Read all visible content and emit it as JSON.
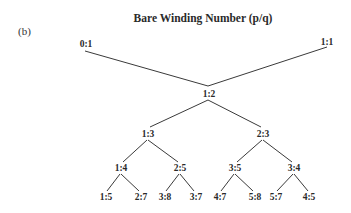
{
  "figure": {
    "panel_label": "(b)",
    "title": "Bare Winding Number (p/q)"
  },
  "tree": {
    "type": "Farey tree",
    "nodes": [
      {
        "id": "n01",
        "label": "0:1",
        "level": 0,
        "x": 86,
        "y": 47,
        "anchor": "middle"
      },
      {
        "id": "n11",
        "label": "1:1",
        "level": 0,
        "x": 327,
        "y": 45,
        "anchor": "middle"
      },
      {
        "id": "n12",
        "label": "1:2",
        "level": 1,
        "x": 209,
        "y": 97,
        "anchor": "middle"
      },
      {
        "id": "n13",
        "label": "1:3",
        "level": 2,
        "x": 148,
        "y": 137,
        "anchor": "middle"
      },
      {
        "id": "n23",
        "label": "2:3",
        "level": 2,
        "x": 263,
        "y": 137,
        "anchor": "middle"
      },
      {
        "id": "n14",
        "label": "1:4",
        "level": 3,
        "x": 121,
        "y": 171,
        "anchor": "middle"
      },
      {
        "id": "n25",
        "label": "2:5",
        "level": 3,
        "x": 180,
        "y": 171,
        "anchor": "middle"
      },
      {
        "id": "n35",
        "label": "3:5",
        "level": 3,
        "x": 235,
        "y": 171,
        "anchor": "middle"
      },
      {
        "id": "n34",
        "label": "3:4",
        "level": 3,
        "x": 294,
        "y": 171,
        "anchor": "middle"
      },
      {
        "id": "n15",
        "label": "1:5",
        "level": 4,
        "x": 106,
        "y": 200,
        "anchor": "middle"
      },
      {
        "id": "n27",
        "label": "2:7",
        "level": 4,
        "x": 141,
        "y": 200,
        "anchor": "middle"
      },
      {
        "id": "n38",
        "label": "3:8",
        "level": 4,
        "x": 165,
        "y": 200,
        "anchor": "middle"
      },
      {
        "id": "n37",
        "label": "3:7",
        "level": 4,
        "x": 196,
        "y": 200,
        "anchor": "middle"
      },
      {
        "id": "n47",
        "label": "4:7",
        "level": 4,
        "x": 220,
        "y": 200,
        "anchor": "middle"
      },
      {
        "id": "n58",
        "label": "5:8",
        "level": 4,
        "x": 255,
        "y": 200,
        "anchor": "middle"
      },
      {
        "id": "n57",
        "label": "5:7",
        "level": 4,
        "x": 276,
        "y": 200,
        "anchor": "middle"
      },
      {
        "id": "n45",
        "label": "4:5",
        "level": 4,
        "x": 309,
        "y": 200,
        "anchor": "middle"
      }
    ],
    "edges": [
      {
        "from": "0:1",
        "to": "1:2",
        "x1": 85,
        "y1": 51,
        "x2": 208,
        "y2": 86
      },
      {
        "from": "1:1",
        "to": "1:2",
        "x1": 327,
        "y1": 47,
        "x2": 208,
        "y2": 86
      },
      {
        "from": "1:2",
        "to": "1:3",
        "x1": 208,
        "y1": 100,
        "x2": 150,
        "y2": 127
      },
      {
        "from": "1:2",
        "to": "2:3",
        "x1": 208,
        "y1": 100,
        "x2": 261,
        "y2": 127
      },
      {
        "from": "1:3",
        "to": "1:4",
        "x1": 147,
        "y1": 140,
        "x2": 123,
        "y2": 162
      },
      {
        "from": "1:3",
        "to": "2:5",
        "x1": 148,
        "y1": 140,
        "x2": 178,
        "y2": 162
      },
      {
        "from": "2:3",
        "to": "3:5",
        "x1": 262,
        "y1": 140,
        "x2": 237,
        "y2": 162
      },
      {
        "from": "2:3",
        "to": "3:4",
        "x1": 263,
        "y1": 140,
        "x2": 292,
        "y2": 162
      },
      {
        "from": "1:4",
        "to": "1:5",
        "x1": 120,
        "y1": 174,
        "x2": 107,
        "y2": 191
      },
      {
        "from": "1:4",
        "to": "2:7",
        "x1": 121,
        "y1": 174,
        "x2": 139,
        "y2": 191
      },
      {
        "from": "2:5",
        "to": "3:8",
        "x1": 179,
        "y1": 174,
        "x2": 166,
        "y2": 191
      },
      {
        "from": "2:5",
        "to": "3:7",
        "x1": 180,
        "y1": 174,
        "x2": 194,
        "y2": 191
      },
      {
        "from": "3:5",
        "to": "4:7",
        "x1": 234,
        "y1": 174,
        "x2": 221,
        "y2": 191
      },
      {
        "from": "3:5",
        "to": "5:8",
        "x1": 235,
        "y1": 174,
        "x2": 253,
        "y2": 191
      },
      {
        "from": "3:4",
        "to": "5:7",
        "x1": 293,
        "y1": 174,
        "x2": 277,
        "y2": 191
      },
      {
        "from": "3:4",
        "to": "4:5",
        "x1": 294,
        "y1": 174,
        "x2": 308,
        "y2": 191
      }
    ]
  },
  "colors": {
    "background": "#ffffff",
    "line": "#3a3a3a",
    "text": "#2a2a2a"
  }
}
